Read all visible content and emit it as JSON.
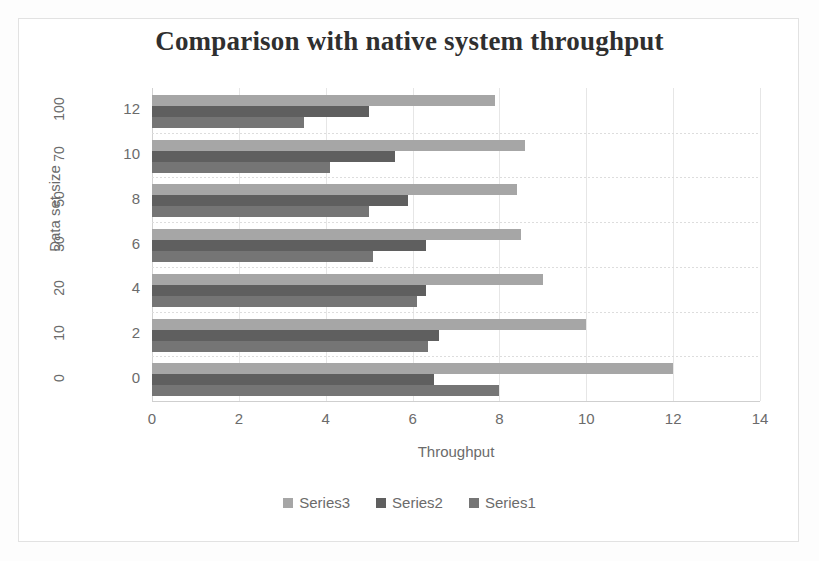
{
  "chart_data": {
    "type": "bar",
    "orientation": "horizontal",
    "title": "Comparison with native system throughput",
    "xlabel": "Throughput",
    "ylabel": "Data set size",
    "xlim": [
      0,
      14
    ],
    "xticks": [
      "0",
      "2",
      "4",
      "6",
      "8",
      "10",
      "12",
      "14"
    ],
    "grid": true,
    "legend_position": "bottom",
    "categories": [
      "0",
      "2",
      "4",
      "6",
      "8",
      "10",
      "12"
    ],
    "categories_outer": [
      "0",
      "10",
      "20",
      "30",
      "50",
      "70",
      "100"
    ],
    "series": [
      {
        "name": "Series1",
        "color": "#757575",
        "values": [
          8.0,
          6.35,
          6.1,
          5.1,
          5.0,
          4.1,
          3.5
        ]
      },
      {
        "name": "Series2",
        "color": "#5f5f5f",
        "values": [
          6.5,
          6.6,
          6.3,
          6.3,
          5.9,
          5.6,
          5.0
        ]
      },
      {
        "name": "Series3",
        "color": "#a6a6a6",
        "values": [
          12.0,
          10.0,
          9.0,
          8.5,
          8.4,
          8.6,
          7.9
        ]
      }
    ]
  },
  "legend": {
    "items": [
      {
        "label": "Series3",
        "color": "#a6a6a6"
      },
      {
        "label": "Series2",
        "color": "#5f5f5f"
      },
      {
        "label": "Series1",
        "color": "#757575"
      }
    ]
  }
}
